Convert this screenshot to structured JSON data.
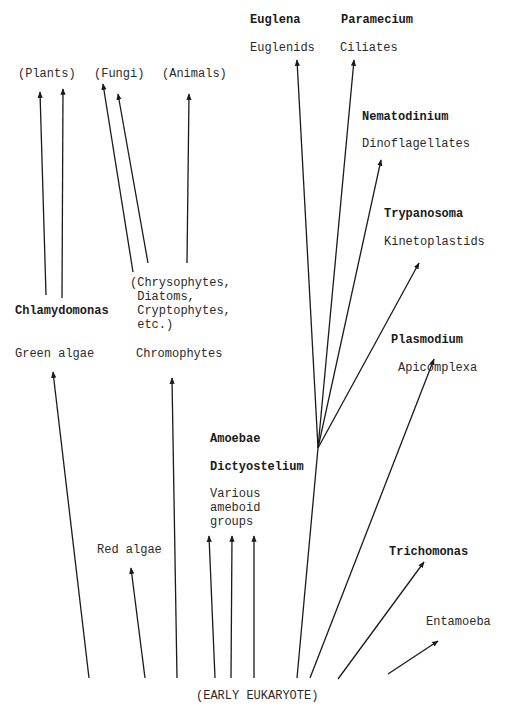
{
  "diagram": {
    "type": "phylogenetic-tree",
    "root_label": "(EARLY EUKARYOTE)",
    "line_color": "#1a1a1a",
    "groups": [
      {
        "id": "plants",
        "label": "(Plants)"
      },
      {
        "id": "fungi",
        "label": "(Fungi)"
      },
      {
        "id": "animals",
        "label": "(Animals)"
      },
      {
        "id": "euglenids",
        "example": "Euglena",
        "label": "Euglenids"
      },
      {
        "id": "ciliates",
        "example": "Paramecium",
        "label": "Ciliates"
      },
      {
        "id": "dinoflagellates",
        "example": "Nematodinium",
        "label": "Dinoflagellates"
      },
      {
        "id": "kinetoplastids",
        "example": "Trypanosoma",
        "label": "Kinetoplastids"
      },
      {
        "id": "apicomplexa",
        "example": "Plasmodium",
        "label": "Apicomplexa"
      },
      {
        "id": "green-algae",
        "example": "Chlamydomonas",
        "label": "Green algae"
      },
      {
        "id": "chromophytes",
        "label": "Chromophytes",
        "note": "(Chrysophytes,\n Diatoms,\n Cryptophytes,\n etc.)"
      },
      {
        "id": "ameboid",
        "example1": "Amoebae",
        "example2": "Dictyostelium",
        "label": "Various\nameboid\ngroups"
      },
      {
        "id": "red-algae",
        "label": "Red algae"
      },
      {
        "id": "trichomonas",
        "example": "Trichomonas"
      },
      {
        "id": "entamoeba",
        "label": "Entamoeba"
      }
    ]
  }
}
